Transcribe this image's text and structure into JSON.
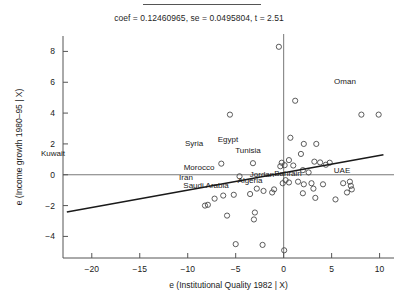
{
  "figure": {
    "has_fraction_bar_top": true,
    "subtitle": "coef = 0.12460965, se = 0.0495804, t = 2.51"
  },
  "chart_data": {
    "type": "scatter",
    "title": "",
    "subtitle": "coef = 0.12460965, se = 0.0495804, t = 2.51",
    "xlabel": "e (Institutional Quality 1982 | X)",
    "ylabel": "e (Income growth 1980–95 | X)",
    "xlim": [
      -23.0,
      11.5
    ],
    "ylim": [
      -5.4,
      9.0
    ],
    "xticks": [
      -20,
      -15,
      -10,
      -5,
      0,
      5,
      10
    ],
    "xtick_labels": [
      "−20",
      "−15",
      "−10",
      "−5",
      "0",
      "5",
      "10"
    ],
    "yticks": [
      -4,
      -2,
      0,
      2,
      4,
      6,
      8
    ],
    "ytick_labels": [
      "−4",
      "−2",
      "0",
      "2",
      "4",
      "6",
      "8"
    ],
    "grid": false,
    "legend": null,
    "coef": 0.12460965,
    "se": 0.0495804,
    "t": 2.51,
    "fit_line": {
      "slope": 0.12460965,
      "x_start": -22.6,
      "y_start": -2.42,
      "x_end": 10.4,
      "y_end": 1.3
    },
    "reference_lines": [
      {
        "orientation": "horizontal",
        "value": 0
      },
      {
        "orientation": "vertical",
        "value": 0
      }
    ],
    "points": [
      {
        "x": -0.5,
        "y": 8.3
      },
      {
        "x": 1.2,
        "y": 4.8
      },
      {
        "x": 8.1,
        "y": 3.9
      },
      {
        "x": 9.9,
        "y": 3.9
      },
      {
        "x": -5.6,
        "y": 3.9
      },
      {
        "x": 0.7,
        "y": 2.4
      },
      {
        "x": 2.1,
        "y": 2.0
      },
      {
        "x": 3.4,
        "y": 2.0
      },
      {
        "x": 1.8,
        "y": 1.35
      },
      {
        "x": 0.55,
        "y": 0.95
      },
      {
        "x": -0.2,
        "y": 0.78
      },
      {
        "x": 0.1,
        "y": 0.62
      },
      {
        "x": 1.0,
        "y": 0.6
      },
      {
        "x": -0.35,
        "y": 0.55
      },
      {
        "x": 3.2,
        "y": 0.85
      },
      {
        "x": 3.8,
        "y": 0.8
      },
      {
        "x": 4.8,
        "y": 0.78
      },
      {
        "x": 4.4,
        "y": 0.65
      },
      {
        "x": -3.2,
        "y": 0.75
      },
      {
        "x": -6.5,
        "y": 0.72
      },
      {
        "x": 2.0,
        "y": 0.3
      },
      {
        "x": 2.6,
        "y": 0.15
      },
      {
        "x": -4.6,
        "y": -0.1
      },
      {
        "x": 0.2,
        "y": -0.35
      },
      {
        "x": -0.1,
        "y": -0.55
      },
      {
        "x": 0.55,
        "y": -0.5
      },
      {
        "x": 1.5,
        "y": -0.45
      },
      {
        "x": 2.1,
        "y": -0.62
      },
      {
        "x": 2.9,
        "y": -0.55
      },
      {
        "x": 3.1,
        "y": -0.9
      },
      {
        "x": 4.1,
        "y": -0.62
      },
      {
        "x": 6.2,
        "y": -0.55
      },
      {
        "x": 6.9,
        "y": -0.45
      },
      {
        "x": 7.0,
        "y": -0.72
      },
      {
        "x": 7.1,
        "y": -0.95
      },
      {
        "x": 6.6,
        "y": -1.15
      },
      {
        "x": 5.4,
        "y": -1.6
      },
      {
        "x": 3.3,
        "y": -1.5
      },
      {
        "x": 2.0,
        "y": -1.2
      },
      {
        "x": -1.0,
        "y": -0.95
      },
      {
        "x": -1.2,
        "y": -1.15
      },
      {
        "x": -2.1,
        "y": -1.05
      },
      {
        "x": -2.8,
        "y": -0.9
      },
      {
        "x": -3.5,
        "y": -1.25
      },
      {
        "x": -5.2,
        "y": -1.3
      },
      {
        "x": -6.3,
        "y": -1.35
      },
      {
        "x": -7.2,
        "y": -1.55
      },
      {
        "x": -7.9,
        "y": -1.95
      },
      {
        "x": -8.2,
        "y": -2.0
      },
      {
        "x": -5.9,
        "y": -2.65
      },
      {
        "x": -3.0,
        "y": -2.45
      },
      {
        "x": -3.1,
        "y": -2.9
      },
      {
        "x": -5.0,
        "y": -4.5
      },
      {
        "x": -2.2,
        "y": -4.55
      },
      {
        "x": 0.05,
        "y": -4.9
      }
    ],
    "annotations": [
      {
        "label": "Kuwait",
        "x_px": 53,
        "y_px": 156
      },
      {
        "label": "Oman",
        "x_px": 345,
        "y_px": 84
      },
      {
        "label": "Syria",
        "x_px": 194,
        "y_px": 146
      },
      {
        "label": "Egypt",
        "x_px": 228,
        "y_px": 142
      },
      {
        "label": "Tunisia",
        "x_px": 248,
        "y_px": 153
      },
      {
        "label": "Morocco",
        "x_px": 199,
        "y_px": 170
      },
      {
        "label": "Iran",
        "x_px": 186,
        "y_px": 180
      },
      {
        "label": "Saudi Arabia",
        "x_px": 206,
        "y_px": 188
      },
      {
        "label": "Algeria",
        "x_px": 250,
        "y_px": 183
      },
      {
        "label": "Jordan",
        "x_px": 262,
        "y_px": 177
      },
      {
        "label": "Bahrain",
        "x_px": 288,
        "y_px": 176
      },
      {
        "label": "UAE",
        "x_px": 342,
        "y_px": 173
      }
    ]
  }
}
